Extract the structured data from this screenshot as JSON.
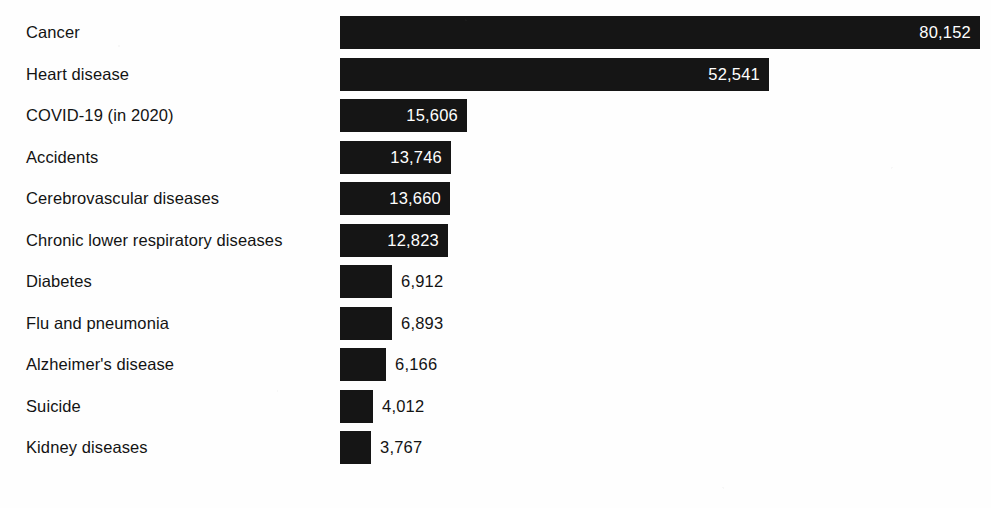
{
  "chart_data": {
    "type": "bar",
    "orientation": "horizontal",
    "title": "",
    "subtitle": "",
    "xlabel": "",
    "ylabel": "",
    "grid": false,
    "legend": null,
    "axis_visible": false,
    "xlim": [
      0,
      80152
    ],
    "categories": [
      "Cancer",
      "Heart disease",
      "COVID-19 (in 2020)",
      "Accidents",
      "Cerebrovascular diseases",
      "Chronic lower respiratory diseases",
      "Diabetes",
      "Flu and pneumonia",
      "Alzheimer's disease",
      "Suicide",
      "Kidney diseases"
    ],
    "values": [
      80152,
      52541,
      15606,
      13746,
      13660,
      12823,
      6912,
      6893,
      6166,
      4012,
      3767
    ],
    "value_labels": [
      "80,152",
      "52,541",
      "15,606",
      "13,746",
      "13,660",
      "12,823",
      "6,912",
      "6,893",
      "6,166",
      "4,012",
      "3,767"
    ],
    "label_placement": [
      "inside",
      "inside",
      "inside",
      "inside",
      "inside",
      "inside",
      "outside",
      "outside",
      "outside",
      "outside",
      "outside"
    ],
    "colors": {
      "bar": "#151515",
      "background": "#fefefe",
      "label_text": "#131313",
      "value_text_inside": "#ffffff",
      "value_text_outside": "#131313"
    }
  },
  "layout": {
    "bar_origin_x": 340,
    "bar_max_end_x": 980,
    "bar_pixel_ends": [
      980,
      769,
      467,
      451,
      450,
      448,
      392,
      392,
      386,
      373,
      371
    ],
    "row_top_y": [
      12,
      54,
      95,
      137,
      178,
      220,
      261,
      303,
      344,
      386,
      427
    ],
    "bar_height": 33,
    "row_pitch": 41.5
  }
}
